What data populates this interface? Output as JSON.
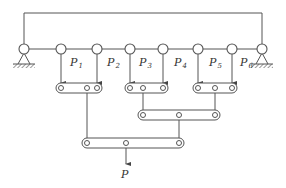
{
  "diagram": {
    "title": "",
    "stroke_color": "#555555",
    "frame": {
      "y": 13,
      "x_left": 24,
      "x_right": 262
    },
    "top_beam": {
      "y": 49
    },
    "supports": [
      {
        "name": "left-support",
        "x": 24
      },
      {
        "name": "right-support",
        "x": 262
      }
    ],
    "loads": [
      {
        "name": "P",
        "sub": "1",
        "x": 61
      },
      {
        "name": "P",
        "sub": "2",
        "x": 97
      },
      {
        "name": "P",
        "sub": "3",
        "x": 129
      },
      {
        "name": "P",
        "sub": "4",
        "x": 163
      },
      {
        "name": "P",
        "sub": "5",
        "x": 197
      },
      {
        "name": "P",
        "sub": "6",
        "x": 232
      }
    ],
    "labels": {
      "p1": "P",
      "p1_sub": "1",
      "p2": "P",
      "p2_sub": "2",
      "p3": "P",
      "p3_sub": "3",
      "p4": "P",
      "p4_sub": "4",
      "p5": "P",
      "p5_sub": "5",
      "p6": "P",
      "p6_sub": "6",
      "output": "P"
    },
    "levers": [
      {
        "name": "lever-a",
        "y": 88,
        "x1": 61,
        "pin": 87,
        "x2": 97
      },
      {
        "name": "lever-b",
        "y": 88,
        "x1": 130,
        "pin": 143,
        "x2": 163
      },
      {
        "name": "lever-c",
        "y": 88,
        "x1": 198,
        "pin": 215,
        "x2": 232
      },
      {
        "name": "lever-d",
        "y": 115,
        "x1": 143,
        "pin": 179,
        "x2": 215
      },
      {
        "name": "lever-e",
        "y": 143,
        "x1": 87,
        "pin": 126,
        "x2": 179
      }
    ]
  }
}
